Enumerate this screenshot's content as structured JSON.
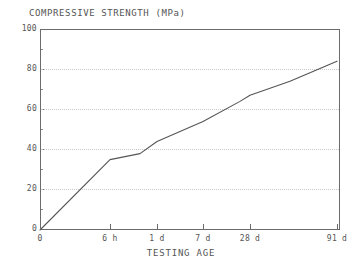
{
  "chart_data": {
    "type": "line",
    "title": "COMPRESSIVE STRENGTH (MPa)",
    "xlabel": "TESTING AGE",
    "ylabel": "COMPRESSIVE STRENGTH (MPa)",
    "ylim": [
      0,
      100
    ],
    "yticks": [
      0,
      20,
      40,
      60,
      80,
      100
    ],
    "ytick_labels": [
      "0",
      "20",
      "40",
      "60",
      "80",
      "100"
    ],
    "yminor_ticks": [
      10,
      30,
      50,
      70,
      90
    ],
    "xtick_labels": [
      "0",
      "6 h",
      "1 d",
      "7 d",
      "28 d",
      "91 d"
    ],
    "xtick_positions": [
      0,
      70,
      117,
      163,
      210,
      297
    ],
    "grid": "horizontal-dotted",
    "legend": "none",
    "series": [
      {
        "name": "compressive strength",
        "points": [
          {
            "x_label": "0",
            "x_px": 0,
            "y": 0
          },
          {
            "x_label": "6 h",
            "x_px": 70,
            "y": 35
          },
          {
            "x_label": "",
            "x_px": 100,
            "y": 38
          },
          {
            "x_label": "1 d",
            "x_px": 117,
            "y": 44
          },
          {
            "x_label": "",
            "x_px": 140,
            "y": 49
          },
          {
            "x_label": "7 d",
            "x_px": 163,
            "y": 54
          },
          {
            "x_label": "",
            "x_px": 200,
            "y": 64
          },
          {
            "x_label": "28 d",
            "x_px": 210,
            "y": 67
          },
          {
            "x_label": "",
            "x_px": 250,
            "y": 74
          },
          {
            "x_label": "91 d",
            "x_px": 297,
            "y": 84
          }
        ]
      }
    ],
    "line_color": "#555555",
    "grid_color": "#c8c8c8",
    "axis_color": "#6b6b6b",
    "background_color": "#ffffff"
  }
}
